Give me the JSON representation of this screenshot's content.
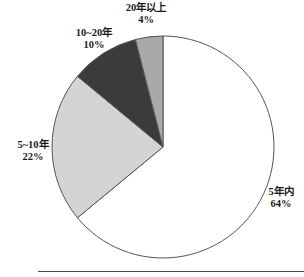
{
  "chart_data": {
    "type": "pie",
    "title": "",
    "subtitle": "",
    "xlabel": "",
    "ylabel": "",
    "legend": "none",
    "labels_position": "outside",
    "grid": false,
    "start_angle_deg": 0,
    "direction": "clockwise",
    "categories": [
      "5年内",
      "5~10年",
      "10~20年",
      "20年以上"
    ],
    "values": [
      64,
      22,
      10,
      4
    ],
    "value_unit": "%",
    "slices": [
      {
        "name": "5年内",
        "value": 64,
        "value_text": "64%",
        "color": "#ffffff",
        "start_deg": 0,
        "end_deg": 230.4
      },
      {
        "name": "5~10年",
        "value": 22,
        "value_text": "22%",
        "color": "#d4d4d4",
        "start_deg": 230.4,
        "end_deg": 309.6
      },
      {
        "name": "10~20年",
        "value": 10,
        "value_text": "10%",
        "color": "#3b3b3b",
        "start_deg": 309.6,
        "end_deg": 345.6
      },
      {
        "name": "20年以上",
        "value": 4,
        "value_text": "4%",
        "color": "#a9a9a9",
        "start_deg": 345.6,
        "end_deg": 360
      }
    ],
    "outline_color": "#555555",
    "background_color": "#ffffff"
  },
  "labels": {
    "over20": {
      "name": "20年以上",
      "value": "4%"
    },
    "ten_to_twenty": {
      "name": "10~20年",
      "value": "10%"
    },
    "five_to_ten": {
      "name": "5~10年",
      "value": "22%"
    },
    "within5": {
      "name": "5年内",
      "value": "64%"
    }
  }
}
